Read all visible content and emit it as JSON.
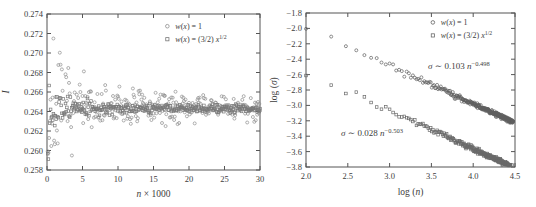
{
  "figure": {
    "background": "#ffffff",
    "text_color": "#3d3d3d",
    "frame_color": "#555555"
  },
  "chart_data": [
    {
      "id": "convergence-plot",
      "type": "scatter",
      "title": "",
      "xlabel": "n × 1000",
      "ylabel": "I",
      "xlabel_segments": [
        {
          "t": "n",
          "i": true
        },
        {
          "t": " × 1000"
        }
      ],
      "ylabel_segments": [
        {
          "t": "I",
          "i": true
        }
      ],
      "xlim": [
        0,
        30
      ],
      "ylim": [
        0.258,
        0.274
      ],
      "grid": false,
      "xticks": {
        "values": [
          0,
          5,
          10,
          15,
          20,
          25,
          30
        ],
        "labels": [
          "0",
          "5",
          "10",
          "15",
          "20",
          "25",
          "30"
        ]
      },
      "yticks": {
        "values": [
          0.258,
          0.26,
          0.262,
          0.264,
          0.266,
          0.268,
          0.27,
          0.272,
          0.274
        ],
        "labels": [
          "0.258",
          "0.260",
          "0.262",
          "0.264",
          "0.266",
          "0.268",
          "0.270",
          "0.272",
          "0.274"
        ]
      },
      "legend": {
        "position": "top-right-inside",
        "x_frac": 0.565,
        "y_frac": 0.095,
        "row_gap": 13,
        "entries": [
          {
            "marker": "circle",
            "label": "w(x) = 1",
            "segments": [
              {
                "t": "w",
                "i": true
              },
              {
                "t": "("
              },
              {
                "t": "x",
                "i": true
              },
              {
                "t": ") = 1"
              }
            ]
          },
          {
            "marker": "square",
            "label": "w(x) = (3/2) x^(1/2)",
            "segments": [
              {
                "t": "w",
                "i": true
              },
              {
                "t": "("
              },
              {
                "t": "x",
                "i": true
              },
              {
                "t": ") = (3/2) "
              },
              {
                "t": "x",
                "i": true
              },
              {
                "t": "1/2",
                "sup": true
              }
            ]
          }
        ]
      },
      "series": [
        {
          "name": "w(x) = 1",
          "marker": "circle",
          "color": "#8e8e8e",
          "model": {
            "kind": "noisy-constant",
            "center": 0.2644,
            "sigma_coeff": 0.103,
            "x_to_n": 1000,
            "x_start": 0.1,
            "x_step": 0.1,
            "count": 300,
            "seed": 7
          }
        },
        {
          "name": "w(x) = (3/2) x^(1/2)",
          "marker": "square",
          "color": "#787878",
          "model": {
            "kind": "noisy-constant",
            "center": 0.2643,
            "sigma_coeff": 0.028,
            "x_to_n": 1000,
            "x_start": 0.1,
            "x_step": 0.1,
            "count": 300,
            "seed": 13
          }
        }
      ]
    },
    {
      "id": "error-scaling-plot",
      "type": "scatter",
      "title": "",
      "xlabel": "log (n)",
      "ylabel": "log (σ)",
      "xlabel_segments": [
        {
          "t": "log ("
        },
        {
          "t": "n",
          "i": true
        },
        {
          "t": ")"
        }
      ],
      "ylabel_segments": [
        {
          "t": "log ("
        },
        {
          "t": "σ",
          "i": true
        },
        {
          "t": ")"
        }
      ],
      "xlim": [
        2.0,
        4.5
      ],
      "ylim": [
        -3.8,
        -1.8
      ],
      "grid": false,
      "xticks": {
        "values": [
          2.0,
          2.5,
          3.0,
          3.5,
          4.0,
          4.5
        ],
        "labels": [
          "2.0",
          "2.5",
          "3.0",
          "3.5",
          "4.0",
          "4.5"
        ]
      },
      "yticks": {
        "values": [
          -1.8,
          -2.0,
          -2.2,
          -2.4,
          -2.6,
          -2.8,
          -3.0,
          -3.2,
          -3.4,
          -3.6,
          -3.8
        ],
        "labels": [
          "−1.8",
          "−2.0",
          "−2.2",
          "−2.4",
          "−2.6",
          "−2.8",
          "−3.0",
          "−3.2",
          "−3.4",
          "−3.6",
          "−3.8"
        ]
      },
      "legend": {
        "position": "top-right-inside",
        "x_frac": 0.607,
        "y_frac": 0.078,
        "row_gap": 13,
        "entries": [
          {
            "marker": "circle",
            "label": "w(x) = 1",
            "segments": [
              {
                "t": "w",
                "i": true
              },
              {
                "t": "("
              },
              {
                "t": "x",
                "i": true
              },
              {
                "t": ") = 1"
              }
            ]
          },
          {
            "marker": "square",
            "label": "w(x) = (3/2) x^(1/2)",
            "segments": [
              {
                "t": "w",
                "i": true
              },
              {
                "t": "("
              },
              {
                "t": "x",
                "i": true
              },
              {
                "t": ") = (3/2) "
              },
              {
                "t": "x",
                "i": true
              },
              {
                "t": "1/2",
                "sup": true
              }
            ]
          }
        ]
      },
      "annotations": [
        {
          "x": 3.46,
          "y": -2.53,
          "anchor": "start",
          "label": "σ ∼ 0.103 n^(−0.498)",
          "segments": [
            {
              "t": "σ",
              "i": true
            },
            {
              "t": " ∼ 0.103 "
            },
            {
              "t": "n",
              "i": true
            },
            {
              "t": "−0.498",
              "sup": true
            }
          ]
        },
        {
          "x": 2.42,
          "y": -3.4,
          "anchor": "start",
          "label": "σ ∼ 0.028 n^(−0.503)",
          "segments": [
            {
              "t": "σ",
              "i": true
            },
            {
              "t": " ∼ 0.028 "
            },
            {
              "t": "n",
              "i": true
            },
            {
              "t": "−0.503",
              "sup": true
            }
          ]
        }
      ],
      "series": [
        {
          "name": "w(x) = 1",
          "marker": "circle",
          "color": "#5f5f5f",
          "fit": {
            "amplitude": 0.103,
            "exponent": -0.498
          },
          "model": {
            "kind": "power-law",
            "amp": 0.103,
            "exp": -0.498,
            "n_start": 100,
            "n_step": 100,
            "count": 300,
            "noise0": 0.04,
            "noise_slope": -0.006,
            "seed": 21
          }
        },
        {
          "name": "w(x) = (3/2) x^(1/2)",
          "marker": "square",
          "color": "#6a6a6a",
          "fit": {
            "amplitude": 0.028,
            "exponent": -0.503
          },
          "model": {
            "kind": "power-law",
            "amp": 0.028,
            "exp": -0.503,
            "n_start": 100,
            "n_step": 100,
            "count": 300,
            "noise0": 0.04,
            "noise_slope": -0.006,
            "seed": 29
          }
        }
      ]
    }
  ]
}
